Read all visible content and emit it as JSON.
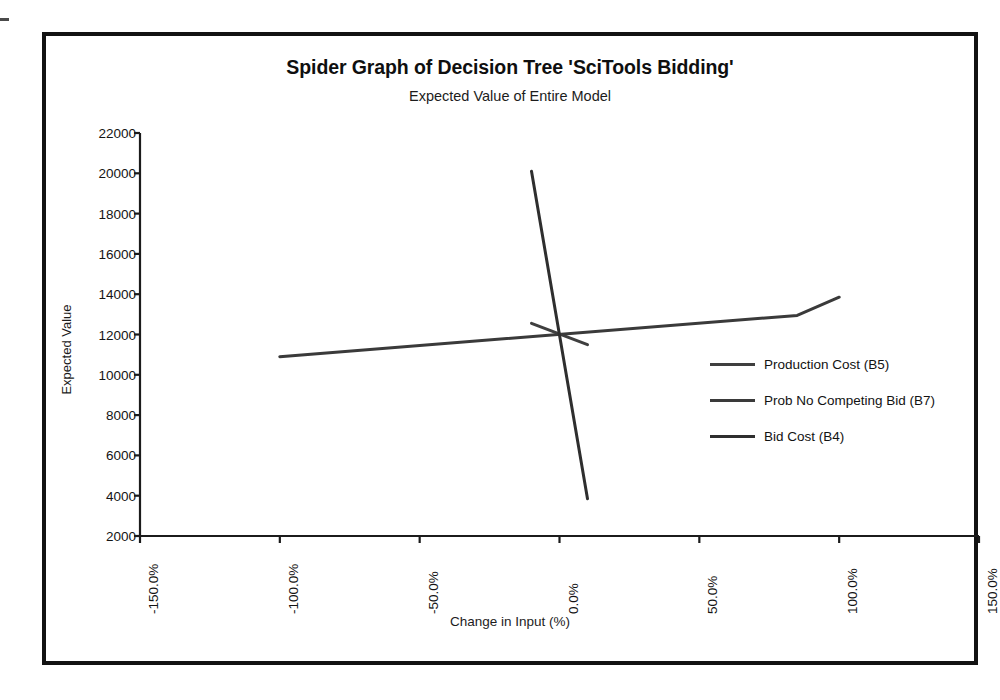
{
  "chart_data": {
    "type": "line",
    "title": "Spider Graph of Decision Tree 'SciTools Bidding'",
    "subtitle": "Expected Value of Entire Model",
    "xlabel": "Change in Input (%)",
    "ylabel": "Expected Value",
    "xlim": [
      -150,
      150
    ],
    "ylim": [
      2000,
      22000
    ],
    "xticks": [
      "-150.0%",
      "-100.0%",
      "-50.0%",
      "0.0%",
      "50.0%",
      "100.0%",
      "150.0%"
    ],
    "xtick_values": [
      -150,
      -100,
      -50,
      0,
      50,
      100,
      150
    ],
    "yticks": [
      "22000",
      "20000",
      "18000",
      "16000",
      "14000",
      "12000",
      "10000",
      "8000",
      "6000",
      "4000",
      "2000"
    ],
    "ytick_values": [
      22000,
      20000,
      18000,
      16000,
      14000,
      12000,
      10000,
      8000,
      6000,
      4000,
      2000
    ],
    "grid": false,
    "legend_position": "right",
    "series": [
      {
        "name": "Production Cost (B5)",
        "color": "#3f3f3f",
        "width": 3,
        "x": [
          -10,
          10
        ],
        "values": [
          12550,
          11500
        ]
      },
      {
        "name": "Prob No Competing Bid (B7)",
        "color": "#3a3a3a",
        "width": 3,
        "x": [
          -100,
          85,
          100
        ],
        "values": [
          10900,
          12950,
          13850
        ]
      },
      {
        "name": "Bid Cost (B4)",
        "color": "#2e2e2e",
        "width": 3,
        "x": [
          -10,
          10
        ],
        "values": [
          20100,
          3850
        ]
      }
    ]
  },
  "legend": {
    "entries": [
      {
        "label": "Production Cost (B5)"
      },
      {
        "label": "Prob No Competing Bid (B7)"
      },
      {
        "label": "Bid Cost (B4)"
      }
    ]
  },
  "colors": {
    "axis": "#1b1b1b",
    "frame": "#121212",
    "text": "#141414",
    "background": "#ffffff"
  }
}
